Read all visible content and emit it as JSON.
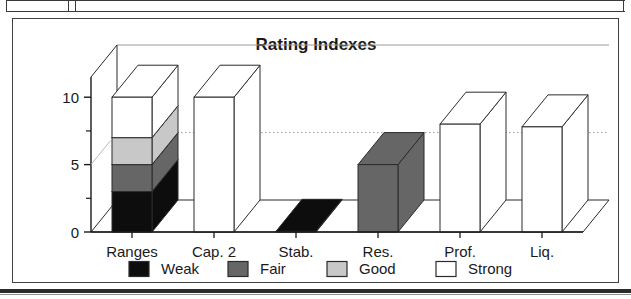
{
  "chart_data": {
    "type": "bar",
    "subtype": "3d-stacked-column",
    "title": "Rating Indexes",
    "xlabel": "",
    "ylabel": "",
    "ylim": [
      0,
      11.5
    ],
    "yticks": [
      0,
      5,
      10
    ],
    "ytick_labels": [
      "0",
      "5",
      "10"
    ],
    "yminorticks": [
      2.5,
      7.5
    ],
    "grid": "horizontal-dotted",
    "legend_position": "bottom",
    "categories": [
      "Ranges",
      "Cap. 2",
      "Stab.",
      "Res.",
      "Prof.",
      "Liq."
    ],
    "series": [
      {
        "name": "Weak",
        "color": "#0d0d0d",
        "values": [
          3,
          0,
          0.05,
          0,
          0,
          0
        ]
      },
      {
        "name": "Fair",
        "color": "#666666",
        "values": [
          2,
          0,
          0,
          5,
          0,
          0
        ]
      },
      {
        "name": "Good",
        "color": "#c8c8c8",
        "values": [
          2,
          0,
          0,
          0,
          0,
          0
        ]
      },
      {
        "name": "Strong",
        "color": "#ffffff",
        "values": [
          3,
          10,
          0,
          0,
          8,
          7.8
        ]
      }
    ],
    "bar_totals": [
      10,
      10,
      0.05,
      5,
      8,
      7.8
    ]
  },
  "legend": {
    "items": [
      {
        "label": "Weak",
        "swatch": "#0d0d0d"
      },
      {
        "label": "Fair",
        "swatch": "#666666"
      },
      {
        "label": "Good",
        "swatch": "#c8c8c8"
      },
      {
        "label": "Strong",
        "swatch": "#ffffff"
      }
    ]
  },
  "colors": {
    "frame": "#404040",
    "axis": "#1a1a1a",
    "grid": "#9a9a9a",
    "outline": "#2b2b2b",
    "page_background": "#ffffff"
  }
}
